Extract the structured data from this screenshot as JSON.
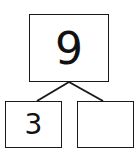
{
  "number_bond": {
    "whole": "9",
    "parts": [
      "3",
      ""
    ]
  },
  "colors": {
    "stroke": "#1a1a1a",
    "background": "#ffffff"
  }
}
